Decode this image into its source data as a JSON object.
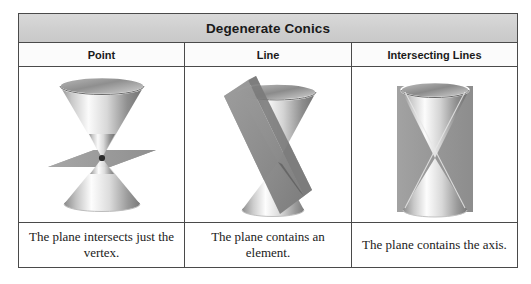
{
  "table": {
    "title": "Degenerate Conics",
    "columns": [
      {
        "header": "Point",
        "figure_name": "double-cone-with-horizontal-plane-through-vertex",
        "caption": "The plane intersects just the vertex."
      },
      {
        "header": "Line",
        "figure_name": "double-cone-with-tangent-tilted-plane",
        "caption": "The plane contains an element."
      },
      {
        "header": "Intersecting Lines",
        "figure_name": "double-cone-with-vertical-plane-through-axis",
        "caption": "The plane contains the axis."
      }
    ]
  },
  "colors": {
    "title_band": "#cfcfcf",
    "border": "#4a4a4a",
    "plane_fill": "#9a9a9a",
    "cone_light": "#fcfcfc",
    "cone_dark": "#6e6e6e",
    "vertex_dot": "#2b2b2b",
    "page_background": "#ffffff"
  }
}
